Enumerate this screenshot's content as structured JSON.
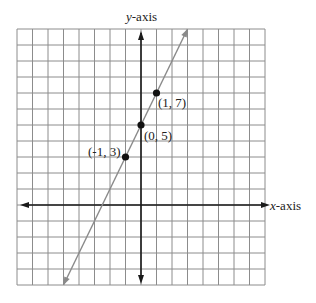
{
  "chart_data": {
    "type": "line",
    "title": "",
    "xlabel": "x-axis",
    "ylabel": "y-axis",
    "xlim": [
      -8,
      8
    ],
    "ylim": [
      -5,
      11
    ],
    "grid": true,
    "axis_origin_px": {
      "x": 142,
      "y": 206
    },
    "series": [
      {
        "name": "line y = 2x + 5",
        "equation": "y = 2x + 5",
        "color": "#8a8a8a",
        "arrows": "both",
        "points": [
          {
            "x": -1,
            "y": 3,
            "label": "(-1, 3)"
          },
          {
            "x": 0,
            "y": 5,
            "label": "(0, 5)"
          },
          {
            "x": 1,
            "y": 7,
            "label": "(1, 7)"
          }
        ]
      }
    ]
  },
  "labels": {
    "x_axis_var": "x",
    "x_axis_suffix": "-axis",
    "y_axis_var": "y",
    "y_axis_suffix": "-axis",
    "p1": "(1, 7)",
    "p2": "(0, 5)",
    "p3": "(-1, 3)"
  },
  "colors": {
    "grid": "#8c8c8c",
    "axes": "#1a1a1a",
    "line": "#8a8a8a",
    "points": "#111111"
  }
}
